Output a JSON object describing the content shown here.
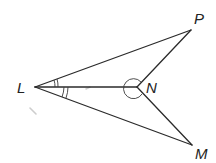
{
  "diagram": {
    "type": "geometry-figure",
    "colors": {
      "line": "#2b2b2b",
      "label": "#222222",
      "background": "#ffffff"
    },
    "points": {
      "L": {
        "label": "L",
        "x": 35,
        "y": 87
      },
      "N": {
        "label": "N",
        "x": 137,
        "y": 87
      },
      "P": {
        "label": "P",
        "x": 191,
        "y": 30
      },
      "M": {
        "label": "M",
        "x": 192,
        "y": 145
      }
    },
    "segments": [
      "LP",
      "PN",
      "LN",
      "NM",
      "LM"
    ],
    "angle_marks": [
      {
        "vertex": "L",
        "angle": "PLN",
        "marks": 2
      },
      {
        "vertex": "L",
        "angle": "NLM",
        "marks": 2
      },
      {
        "vertex": "N",
        "angle": "reflex PNM",
        "marks": 1
      }
    ]
  }
}
